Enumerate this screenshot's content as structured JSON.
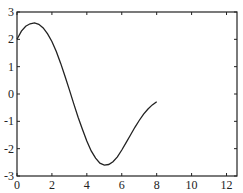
{
  "chart_data": {
    "type": "line",
    "title": "",
    "xlabel": "",
    "ylabel": "",
    "xlim": [
      0,
      12.6
    ],
    "ylim": [
      -3,
      3
    ],
    "grid": false,
    "legend": null,
    "x_ticks": [
      0,
      2,
      4,
      6,
      8,
      10,
      12
    ],
    "y_ticks": [
      -3,
      -2,
      -1,
      0,
      1,
      2,
      3
    ],
    "series": [
      {
        "name": "curve",
        "color": "#222222",
        "x": [
          0,
          0.25,
          0.5,
          0.75,
          1.0,
          1.25,
          1.5,
          1.75,
          2.0,
          2.25,
          2.5,
          2.75,
          3.0,
          3.25,
          3.5,
          3.75,
          4.0,
          4.25,
          4.5,
          4.75,
          5.0,
          5.25,
          5.5,
          5.75,
          6.0,
          6.25,
          6.5,
          6.75,
          7.0,
          7.25,
          7.5,
          7.75,
          8.0
        ],
        "y": [
          2.0,
          2.3,
          2.48,
          2.57,
          2.6,
          2.55,
          2.42,
          2.2,
          1.92,
          1.55,
          1.12,
          0.65,
          0.15,
          -0.35,
          -0.85,
          -1.3,
          -1.72,
          -2.08,
          -2.35,
          -2.53,
          -2.6,
          -2.58,
          -2.48,
          -2.3,
          -2.05,
          -1.78,
          -1.5,
          -1.22,
          -0.97,
          -0.74,
          -0.55,
          -0.4,
          -0.28
        ]
      }
    ]
  }
}
